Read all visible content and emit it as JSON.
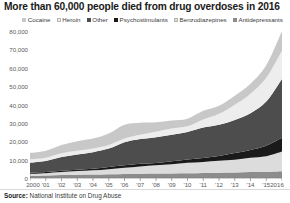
{
  "title": "More than 60,000 people died from drug overdoses in 2016",
  "footer": {
    "source_label": "Source:",
    "source_text": "National Institute on Drug Abuse"
  },
  "legend": {
    "position": "top",
    "items": [
      {
        "label": "Cocaine",
        "color": "#c8c8c8"
      },
      {
        "label": "Heroin",
        "color": "#ededed"
      },
      {
        "label": "Other",
        "color": "#4d4d4d"
      },
      {
        "label": "Psychostimulants",
        "color": "#1a1a1a"
      },
      {
        "label": "Benzodiazepines",
        "color": "#dcdcdc"
      },
      {
        "label": "Antidepressants",
        "color": "#8c8c8c"
      }
    ]
  },
  "axes": {
    "y_ticks": [
      "0",
      "10,000",
      "20,000",
      "30,000",
      "40,000",
      "50,000",
      "60,000",
      "70,000",
      "80,000"
    ],
    "x_ticks": [
      "2000",
      "'01",
      "'02",
      "'03",
      "'04",
      "'05",
      "'06",
      "'07",
      "'08",
      "'09",
      "'10",
      "'11",
      "'12",
      "'13",
      "'14",
      "'15",
      "2016"
    ]
  },
  "chart_data": {
    "type": "area",
    "stacked": true,
    "title": "More than 60,000 people died from drug overdoses in 2016",
    "xlabel": "",
    "ylabel": "",
    "ylim": [
      0,
      80000
    ],
    "ytick_step": 10000,
    "grid": false,
    "legend_position": "top",
    "source": "National Institute on Drug Abuse",
    "x": [
      2000,
      2001,
      2002,
      2003,
      2004,
      2005,
      2006,
      2007,
      2008,
      2009,
      2010,
      2011,
      2012,
      2013,
      2014,
      2015,
      2016
    ],
    "x_labels": [
      "2000",
      "'01",
      "'02",
      "'03",
      "'04",
      "'05",
      "'06",
      "'07",
      "'08",
      "'09",
      "'10",
      "'11",
      "'12",
      "'13",
      "'14",
      "'15",
      "2016"
    ],
    "series": [
      {
        "name": "Antidepressants",
        "color": "#8c8c8c",
        "values": [
          1200,
          1350,
          1600,
          1750,
          1850,
          2000,
          2150,
          2300,
          2400,
          2500,
          2600,
          2750,
          2900,
          3000,
          3200,
          3400,
          3700
        ]
      },
      {
        "name": "Benzodiazepines",
        "color": "#dcdcdc",
        "values": [
          1100,
          1300,
          1700,
          2000,
          2300,
          2800,
          3400,
          4000,
          4500,
          5000,
          5700,
          6000,
          6500,
          7000,
          7800,
          8500,
          10700
        ]
      },
      {
        "name": "Psychostimulants",
        "color": "#1a1a1a",
        "values": [
          550,
          600,
          700,
          800,
          900,
          1200,
          1400,
          1400,
          1300,
          1600,
          1800,
          2200,
          2600,
          3600,
          4300,
          5700,
          7500
        ]
      },
      {
        "name": "Other",
        "color": "#4d4d4d",
        "values": [
          5500,
          6000,
          7400,
          8200,
          9000,
          10000,
          12500,
          13500,
          14000,
          14500,
          15000,
          16500,
          17000,
          18000,
          20000,
          24000,
          32000
        ]
      },
      {
        "name": "Heroin",
        "color": "#ededed",
        "values": [
          1800,
          1800,
          2100,
          2100,
          2000,
          2000,
          2100,
          2400,
          3000,
          3300,
          3000,
          4400,
          5900,
          8300,
          10600,
          12900,
          15500
        ]
      },
      {
        "name": "Cocaine",
        "color": "#c8c8c8",
        "values": [
          3500,
          3800,
          4500,
          5200,
          5400,
          6200,
          7400,
          6500,
          5100,
          4400,
          4200,
          4700,
          4400,
          4900,
          5400,
          6800,
          10600
        ]
      }
    ],
    "total": [
      13650,
      14850,
      18000,
      20050,
      21450,
      24200,
      28950,
      30100,
      30300,
      31300,
      32300,
      36550,
      39300,
      44800,
      51300,
      61300,
      80000
    ],
    "annotations": []
  }
}
